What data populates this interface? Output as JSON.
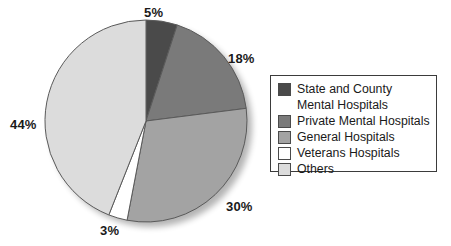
{
  "chart_data": {
    "type": "pie",
    "title": "",
    "categories": [
      "State and County Mental Hospitals",
      "Private Mental Hospitals",
      "General Hospitals",
      "Veterans Hospitals",
      "Others"
    ],
    "values": [
      5,
      18,
      30,
      3,
      44
    ],
    "value_labels": [
      "5%",
      "18%",
      "30%",
      "3%",
      "44%"
    ],
    "unit": "%",
    "start_angle_deg": 0,
    "direction": "clockwise",
    "legend_position": "right",
    "grid": false,
    "colors": [
      "#4a4a4a",
      "#7a7a7a",
      "#a3a3a3",
      "#ffffff",
      "#dcdcdc"
    ],
    "slice_outline_color": "#5a5a5a"
  },
  "labels": {
    "state_county": "5%",
    "private_mental": "18%",
    "general": "30%",
    "veterans": "3%",
    "others": "44%"
  },
  "legend": {
    "entries": [
      {
        "label_line1": "State and County",
        "label_line2": "Mental Hospitals",
        "color": "#4a4a4a"
      },
      {
        "label_line1": "Private Mental Hospitals",
        "label_line2": "",
        "color": "#7a7a7a"
      },
      {
        "label_line1": "General Hospitals",
        "label_line2": "",
        "color": "#a3a3a3"
      },
      {
        "label_line1": "Veterans Hospitals",
        "label_line2": "",
        "color": "#ffffff"
      },
      {
        "label_line1": "Others",
        "label_line2": "",
        "color": "#dcdcdc"
      }
    ]
  }
}
